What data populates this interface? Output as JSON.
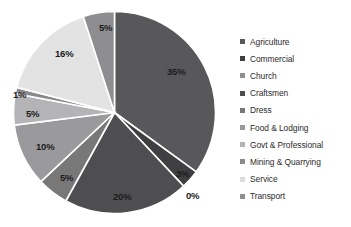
{
  "chart_data": {
    "type": "pie",
    "title": "",
    "subtitle": "",
    "xlabel": "",
    "ylabel": "",
    "grid": false,
    "legend_position": "right",
    "value_unit": "%",
    "start_angle_deg": 0,
    "direction": "clockwise",
    "categories": [
      "Agriculture",
      "Commercial",
      "Church",
      "Craftsmen",
      "Dress",
      "Food & Lodging",
      "Govt & Professional",
      "Mining & Quarrying",
      "Service",
      "Transport"
    ],
    "values": [
      35,
      3,
      0,
      20,
      5,
      10,
      5,
      1,
      16,
      5
    ],
    "data_labels": [
      "35%",
      "3%",
      "0%",
      "20%",
      "5%",
      "10%",
      "5%",
      "1%",
      "16%",
      "5%"
    ],
    "colors": [
      "#58585a",
      "#3f3f41",
      "#6e6e70",
      "#4e4e50",
      "#787879",
      "#9a9a9c",
      "#b4b4b6",
      "#8a8a8c",
      "#e3e3e3",
      "#8e8e90"
    ]
  },
  "legend": {
    "items": [
      {
        "label": "Agriculture",
        "color": "#58585a"
      },
      {
        "label": "Commercial",
        "color": "#3f3f41"
      },
      {
        "label": "Church",
        "color": "#8e8e90"
      },
      {
        "label": "Craftsmen",
        "color": "#4e4e50"
      },
      {
        "label": "Dress",
        "color": "#787879"
      },
      {
        "label": "Food & Lodging",
        "color": "#9a9a9c"
      },
      {
        "label": "Govt & Professional",
        "color": "#b4b4b6"
      },
      {
        "label": "Mining & Quarrying",
        "color": "#8a8a8c"
      },
      {
        "label": "Service",
        "color": "#dcdcdc"
      },
      {
        "label": "Transport",
        "color": "#8e8e90"
      }
    ]
  }
}
